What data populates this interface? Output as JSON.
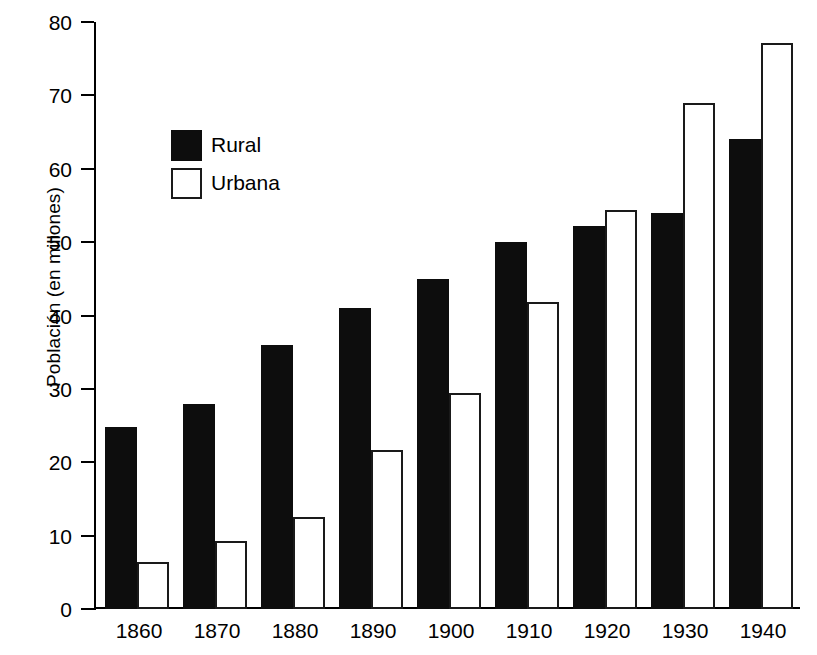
{
  "chart_data": {
    "type": "bar",
    "title": "",
    "xlabel": "",
    "ylabel": "Población (en millones)",
    "categories": [
      "1860",
      "1870",
      "1880",
      "1890",
      "1900",
      "1910",
      "1920",
      "1930",
      "1940"
    ],
    "series": [
      {
        "name": "Rural",
        "color": "#0d0d0d",
        "style": "filled",
        "values": [
          24.8,
          28.0,
          36.0,
          41.0,
          45.0,
          50.0,
          52.2,
          54.0,
          64.0
        ]
      },
      {
        "name": "Urbana",
        "color": "#ffffff",
        "style": "hollow",
        "values": [
          6.4,
          9.3,
          12.5,
          21.7,
          29.5,
          41.8,
          54.4,
          69.0,
          77.2
        ]
      }
    ],
    "ylim": [
      0,
      80
    ],
    "yticks": [
      0,
      10,
      20,
      30,
      40,
      50,
      60,
      70,
      80
    ],
    "ytick_labels": [
      "0",
      "10",
      "20",
      "30",
      "40",
      "50",
      "60",
      "70",
      "80"
    ],
    "grid": false,
    "legend_position": "upper-left-inside",
    "axis_color": "#000000",
    "background": "#ffffff"
  },
  "legend": {
    "items": [
      {
        "label": "Rural",
        "swatch": "filled-square-icon"
      },
      {
        "label": "Urbana",
        "swatch": "hollow-square-icon"
      }
    ]
  }
}
